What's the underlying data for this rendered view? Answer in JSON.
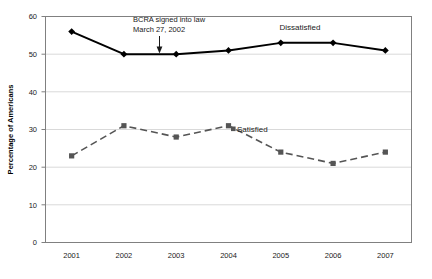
{
  "chart_data": {
    "type": "line",
    "title": "",
    "xlabel": "",
    "ylabel": "Percentage of Americans",
    "categories": [
      "2001",
      "2002",
      "2003",
      "2004",
      "2005",
      "2006",
      "2007"
    ],
    "x": [
      2001,
      2002,
      2003,
      2004,
      2005,
      2006,
      2007
    ],
    "ylim": [
      0,
      60
    ],
    "yticks": [
      0,
      10,
      20,
      30,
      40,
      50,
      60
    ],
    "ytick_labels": [
      "0",
      "10",
      "20",
      "30",
      "40",
      "50",
      "60"
    ],
    "grid": "horizontal",
    "legend_position": "inline-labels",
    "series": [
      {
        "name": "Dissatisfied",
        "values": [
          56,
          50,
          50,
          51,
          53,
          53,
          51
        ],
        "marker": "diamond",
        "line_style": "solid",
        "color": "#000000"
      },
      {
        "name": "Satisfied",
        "values": [
          23,
          31,
          28,
          31,
          24,
          21,
          24
        ],
        "marker": "square",
        "line_style": "dashed",
        "color": "#555555"
      }
    ],
    "annotations": [
      {
        "id": "bcra-annotation",
        "line1": "BCRA signed into law",
        "line2": "March 27, 2002",
        "points_to_x": 2002,
        "points_to_y": 50,
        "arrow": "down"
      }
    ],
    "series_labels": [
      {
        "id": "dissatisfied-label",
        "text": "Dissatisfied",
        "at_x": 2005,
        "at_y": 57
      },
      {
        "id": "satisfied-label",
        "text": "Satisfied",
        "at_x": 2004,
        "at_y": 31
      }
    ]
  },
  "axes": {
    "y_title": "Percentage of Americans",
    "y_ticks": [
      "60",
      "50",
      "40",
      "30",
      "20",
      "10",
      "0"
    ],
    "x_ticks": [
      "2001",
      "2002",
      "2003",
      "2004",
      "2005",
      "2006",
      "2007"
    ]
  },
  "labels": {
    "dissatisfied": "Dissatisfied",
    "satisfied": "Satisfied",
    "annotation_line1": "BCRA signed into law",
    "annotation_line2": "March 27, 2002"
  },
  "colors": {
    "dissatisfied": "#000000",
    "satisfied": "#555555",
    "grid": "#d9d9d9",
    "frame": "#808080",
    "background": "#ffffff"
  }
}
